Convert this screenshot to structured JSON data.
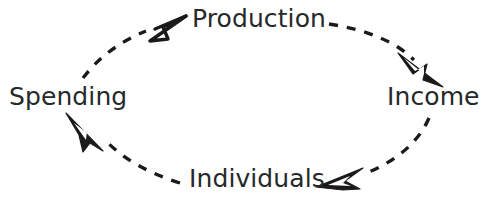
{
  "diagram": {
    "type": "circular-flow-cycle",
    "title": "",
    "background_color": "#ffffff",
    "stroke_color": "#1a1a1a",
    "text_color": "#26292b",
    "direction": "clockwise",
    "nodes": [
      {
        "id": "production",
        "label": "Production",
        "position": "top"
      },
      {
        "id": "income",
        "label": "Income",
        "position": "right"
      },
      {
        "id": "individuals",
        "label": "Individuals",
        "position": "bottom"
      },
      {
        "id": "spending",
        "label": "Spending",
        "position": "left"
      }
    ],
    "connectors": [
      {
        "id": "production-to-income",
        "from": "production",
        "to": "income",
        "style": "dashed",
        "arrowhead": "open-triangle",
        "points": "down-right"
      },
      {
        "id": "income-to-individuals",
        "from": "income",
        "to": "individuals",
        "style": "dashed",
        "arrowhead": "open-triangle",
        "points": "left"
      },
      {
        "id": "individuals-to-spending",
        "from": "individuals",
        "to": "spending",
        "style": "dashed",
        "arrowhead": "open-triangle",
        "points": "up-left"
      },
      {
        "id": "spending-to-production",
        "from": "spending",
        "to": "production",
        "style": "dashed",
        "arrowhead": "open-triangle",
        "points": "up-right"
      }
    ],
    "arrow_icon_names": [
      "arrow-head-upright-icon",
      "arrow-head-downright-icon",
      "arrow-head-left-icon",
      "arrow-head-upleft-icon"
    ]
  }
}
